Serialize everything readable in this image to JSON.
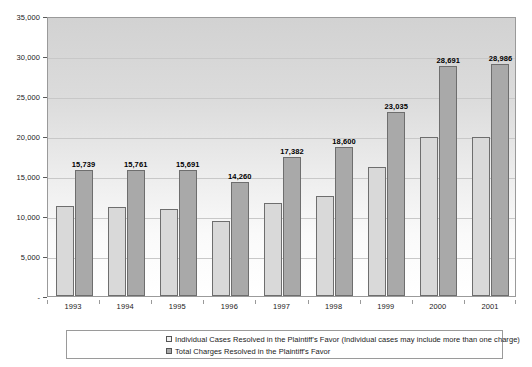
{
  "chart_data": {
    "type": "bar",
    "title": "",
    "subtitle": "",
    "xlabel": "",
    "ylabel": "",
    "categories": [
      "1993",
      "1994",
      "1995",
      "1996",
      "1997",
      "1998",
      "1999",
      "2000",
      "2001"
    ],
    "series": [
      {
        "name": "Individual Cases Resolved in the Plaintiff's Favor (Individual cases may include more than one charge)",
        "color": "#d9d9d9",
        "values": [
          11200,
          11100,
          10900,
          9400,
          11600,
          12500,
          16100,
          19900,
          19900
        ],
        "data_labels": [
          "",
          "",
          "",
          "",
          "",
          "",
          "",
          "",
          ""
        ]
      },
      {
        "name": "Total Charges Resolved in the Plaintiff's Favor",
        "color": "#a9a9a9",
        "values": [
          15739,
          15761,
          15691,
          14260,
          17382,
          18600,
          23035,
          28691,
          28986
        ],
        "data_labels": [
          "15,739",
          "15,761",
          "15,691",
          "14,260",
          "17,382",
          "18,600",
          "23,035",
          "28,691",
          "28,986"
        ]
      }
    ],
    "ylim": [
      0,
      35000
    ],
    "ytick_values": [
      0,
      5000,
      10000,
      15000,
      20000,
      25000,
      30000,
      35000
    ],
    "ytick_labels": [
      "-",
      "5,000",
      "10,000",
      "15,000",
      "20,000",
      "25,000",
      "30,000",
      "35,000"
    ],
    "grid": true,
    "legend_position": "bottom",
    "legend_entries": [
      "Individual Cases Resolved in the Plaintiff's Favor (Individual cases may include more than one charge)",
      "Total Charges Resolved in the Plaintiff's Favor"
    ]
  }
}
